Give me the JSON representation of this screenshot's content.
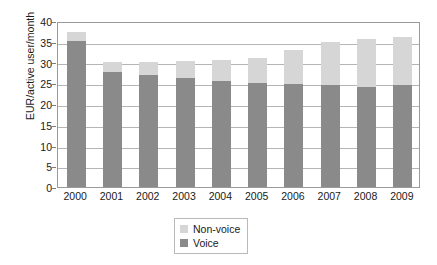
{
  "chart_data": {
    "type": "bar",
    "subtype": "stacked-bar",
    "title": "",
    "xlabel": "",
    "ylabel": "EUR/active user/month",
    "ylim": [
      0,
      40
    ],
    "ytick_step": 5,
    "yticks": [
      "40",
      "35",
      "30",
      "25",
      "20",
      "15",
      "10",
      "5",
      "0"
    ],
    "grid": true,
    "grid_axis": "y",
    "legend_position": "below-right",
    "categories": [
      "2000",
      "2001",
      "2002",
      "2003",
      "2004",
      "2005",
      "2006",
      "2007",
      "2008",
      "2009"
    ],
    "series": [
      {
        "name": "Voice",
        "color": "#8a8a8a",
        "values": [
          35.3,
          27.8,
          27.0,
          26.3,
          25.5,
          25.0,
          24.8,
          24.5,
          24.2,
          24.5
        ]
      },
      {
        "name": "Non-voice",
        "color": "#d6d6d6",
        "values": [
          2.0,
          2.4,
          3.2,
          4.0,
          5.2,
          6.2,
          8.2,
          10.5,
          11.5,
          11.7
        ]
      }
    ],
    "totals": [
      37.3,
      30.2,
      30.2,
      30.3,
      30.7,
      31.2,
      33.0,
      35.0,
      35.7,
      36.2
    ]
  },
  "legend": {
    "items": [
      {
        "label": "Non-voice",
        "color": "#d6d6d6"
      },
      {
        "label": "Voice",
        "color": "#8a8a8a"
      }
    ]
  },
  "colors": {
    "voice": "#8a8a8a",
    "nonvoice": "#d6d6d6",
    "axis": "#9a9a9a",
    "grid": "#b5b5b5",
    "text": "#1a1a1a",
    "background": "#ffffff"
  }
}
